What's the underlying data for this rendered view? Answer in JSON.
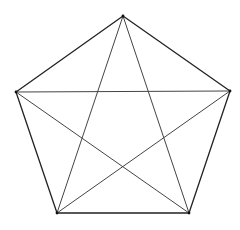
{
  "diagram": {
    "type": "complete-graph-K5",
    "vertices": [
      {
        "id": "top",
        "x": 123,
        "y": 16
      },
      {
        "id": "right",
        "x": 230,
        "y": 91
      },
      {
        "id": "bottom-right",
        "x": 189,
        "y": 213
      },
      {
        "id": "bottom-left",
        "x": 57,
        "y": 213
      },
      {
        "id": "left",
        "x": 16,
        "y": 92
      }
    ],
    "edges": [
      {
        "from": "top",
        "to": "right",
        "kind": "side"
      },
      {
        "from": "right",
        "to": "bottom-right",
        "kind": "side"
      },
      {
        "from": "bottom-right",
        "to": "bottom-left",
        "kind": "side"
      },
      {
        "from": "bottom-left",
        "to": "left",
        "kind": "side"
      },
      {
        "from": "left",
        "to": "top",
        "kind": "side"
      },
      {
        "from": "top",
        "to": "bottom-right",
        "kind": "diagonal"
      },
      {
        "from": "top",
        "to": "bottom-left",
        "kind": "diagonal"
      },
      {
        "from": "right",
        "to": "left",
        "kind": "diagonal"
      },
      {
        "from": "right",
        "to": "bottom-left",
        "kind": "diagonal"
      },
      {
        "from": "left",
        "to": "bottom-right",
        "kind": "diagonal"
      }
    ],
    "colors": {
      "background": "#ffffff",
      "side_stroke": "#222222",
      "diagonal_stroke": "#444444",
      "vertex_fill": "#111111"
    }
  }
}
